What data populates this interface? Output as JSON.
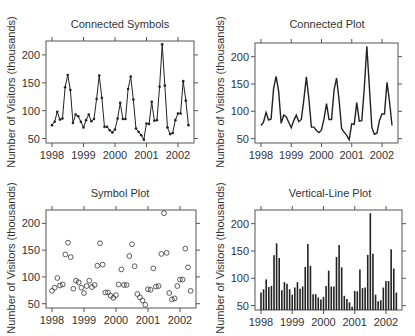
{
  "figure": {
    "ylabel": "Number of Visitors (thousands)",
    "panels": [
      {
        "id": "connected-symbols",
        "title": "Connected Symbols"
      },
      {
        "id": "connected-plot",
        "title": "Connected Plot"
      },
      {
        "id": "symbol-plot",
        "title": "Symbol Plot"
      },
      {
        "id": "vertical-line-plot",
        "title": "Vertical-Line Plot"
      }
    ],
    "x_ticks": [
      "1998",
      "1999",
      "2000",
      "2001",
      "2002"
    ],
    "y_ticks": [
      "50",
      "100",
      "150",
      "200"
    ]
  },
  "chart_data": [
    {
      "type": "line",
      "title": "Connected Symbols",
      "xlabel": "",
      "ylabel": "Number of Visitors (thousands)",
      "x_start": 1998.0,
      "x_step": 0.0833,
      "values": [
        74,
        80,
        98,
        84,
        86,
        142,
        164,
        137,
        78,
        93,
        90,
        80,
        70,
        83,
        93,
        81,
        85,
        121,
        163,
        123,
        71,
        71,
        65,
        61,
        66,
        86,
        114,
        85,
        85,
        139,
        161,
        120,
        68,
        62,
        56,
        48,
        77,
        76,
        116,
        82,
        83,
        143,
        219,
        145,
        70,
        58,
        60,
        83,
        95,
        95,
        153,
        118,
        74
      ],
      "markers": "filled-dot",
      "xticks": [
        1998,
        1999,
        2000,
        2001,
        2002
      ],
      "yticks": [
        50,
        100,
        150,
        200
      ],
      "ylim": [
        42,
        225
      ],
      "grid": false
    },
    {
      "type": "line",
      "title": "Connected Plot",
      "xlabel": "",
      "ylabel": "Number of Visitors (thousands)",
      "x_start": 1998.0,
      "x_step": 0.0833,
      "values": [
        74,
        80,
        98,
        84,
        86,
        142,
        164,
        137,
        78,
        93,
        90,
        80,
        70,
        83,
        93,
        81,
        85,
        121,
        163,
        123,
        71,
        71,
        65,
        61,
        66,
        86,
        114,
        85,
        85,
        139,
        161,
        120,
        68,
        62,
        56,
        48,
        77,
        76,
        116,
        82,
        83,
        143,
        219,
        145,
        70,
        58,
        60,
        83,
        95,
        95,
        153,
        118,
        74
      ],
      "markers": "none",
      "xticks": [
        1998,
        1999,
        2000,
        2001,
        2002
      ],
      "yticks": [
        50,
        100,
        150,
        200
      ],
      "ylim": [
        42,
        225
      ],
      "grid": false
    },
    {
      "type": "scatter",
      "title": "Symbol Plot",
      "xlabel": "",
      "ylabel": "Number of Visitors (thousands)",
      "x_start": 1998.0,
      "x_step": 0.0833,
      "values": [
        74,
        80,
        98,
        84,
        86,
        142,
        164,
        137,
        78,
        93,
        90,
        80,
        70,
        83,
        93,
        81,
        85,
        121,
        163,
        123,
        71,
        71,
        65,
        61,
        66,
        86,
        114,
        85,
        85,
        139,
        161,
        120,
        68,
        62,
        56,
        48,
        77,
        76,
        116,
        82,
        83,
        143,
        219,
        145,
        70,
        58,
        60,
        83,
        95,
        95,
        153,
        118,
        74
      ],
      "markers": "open-circle",
      "xticks": [
        1998,
        1999,
        2000,
        2001,
        2002
      ],
      "yticks": [
        50,
        100,
        150,
        200
      ],
      "ylim": [
        42,
        225
      ],
      "grid": false
    },
    {
      "type": "bar",
      "title": "Vertical-Line Plot",
      "xlabel": "",
      "ylabel": "Number of Visitors (thousands)",
      "x_start": 1998.0,
      "x_step": 0.0833,
      "values": [
        74,
        80,
        98,
        84,
        86,
        142,
        164,
        137,
        78,
        93,
        90,
        80,
        70,
        83,
        93,
        81,
        85,
        121,
        163,
        123,
        71,
        71,
        65,
        61,
        66,
        86,
        114,
        85,
        85,
        139,
        161,
        120,
        68,
        62,
        56,
        48,
        77,
        76,
        116,
        82,
        83,
        143,
        219,
        145,
        70,
        58,
        60,
        83,
        95,
        95,
        153,
        118,
        74
      ],
      "xticks": [
        1998,
        1999,
        2000,
        2001,
        2002
      ],
      "yticks": [
        50,
        100,
        150,
        200
      ],
      "ylim": [
        42,
        225
      ],
      "grid": false
    }
  ]
}
